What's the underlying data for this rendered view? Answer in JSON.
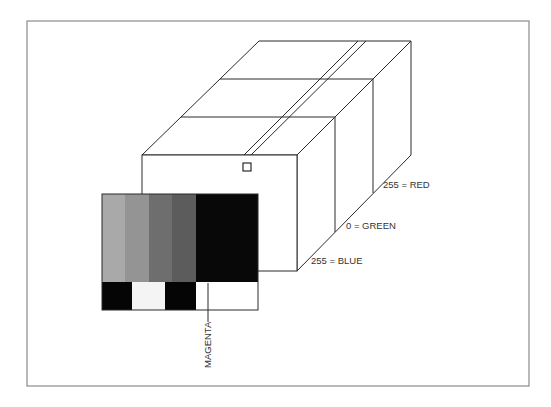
{
  "diagram": {
    "labels": {
      "red": "255 = RED",
      "green": "0 = GREEN",
      "blue": "255 = BLUE",
      "callout": "MAGENTA"
    },
    "colors": {
      "line": "#2a2a2a",
      "frame": "#8a8a8a",
      "background": "#ffffff"
    },
    "swatch": {
      "stripes": [
        "#a9a9a9",
        "#949494",
        "#6e6e6e",
        "#5c5c5c",
        "#080808"
      ],
      "bottom_row": [
        "#050505",
        "#f4f4f4",
        "#050505",
        "#ffffff"
      ]
    }
  }
}
